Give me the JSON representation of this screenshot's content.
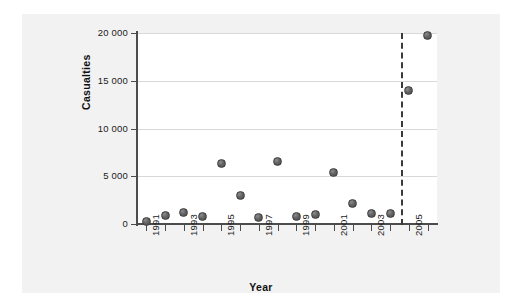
{
  "chart_data": {
    "type": "scatter",
    "title": "",
    "xlabel": "Year",
    "ylabel": "Casualties",
    "xlim": [
      1990.5,
      2006.5
    ],
    "ylim": [
      0,
      20000
    ],
    "grid": true,
    "legend": null,
    "ytick_labels": [
      "0",
      "5 000",
      "10 000",
      "15 000",
      "20 000"
    ],
    "ytick_values": [
      0,
      5000,
      10000,
      15000,
      20000
    ],
    "xtick_labels": [
      "1991",
      "1993",
      "1995",
      "1997",
      "1999",
      "2001",
      "2003",
      "2005"
    ],
    "xtick_values": [
      1991,
      1993,
      1995,
      1997,
      1999,
      2001,
      2003,
      2005
    ],
    "xtick_minor_values": [
      1992,
      1994,
      1996,
      1998,
      2000,
      2002,
      2004,
      2006
    ],
    "x": [
      1991,
      1992,
      1993,
      1994,
      1995,
      1996,
      1997,
      1998,
      1999,
      2000,
      2001,
      2002,
      2003,
      2004,
      2005,
      2006
    ],
    "values": [
      300,
      850,
      1250,
      750,
      6300,
      2950,
      700,
      6500,
      800,
      950,
      5350,
      2100,
      1150,
      1150,
      14000,
      19700
    ],
    "annotations": [
      {
        "name": "forecast-divider",
        "type": "vertical-dashed-line",
        "x": 2004.6
      }
    ],
    "marker_color": "#5a5a5a",
    "grid_color": "#d8d8d8",
    "axis_color": "#4c4c4c"
  }
}
